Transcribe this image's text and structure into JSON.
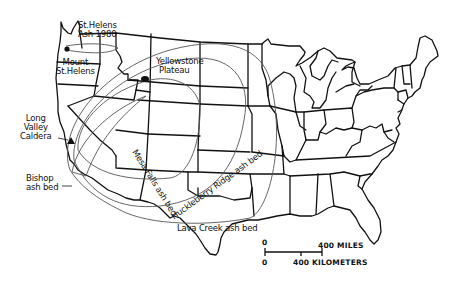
{
  "map": {
    "labels": {
      "st_helens_ash": "St Helens Ash 1980",
      "st_helens_ash_line1": "St.Helens",
      "st_helens_ash_line2": "Ash 1980",
      "mount_st_helens_line1": "Mount",
      "mount_st_helens_line2": "St.Helens",
      "yellowstone_line1": "Yellowstone",
      "yellowstone_line2": "Plateau",
      "long_valley_line1": "Long",
      "long_valley_line2": "Valley",
      "long_valley_line3": "Caldera",
      "bishop_line1": "Bishop",
      "bishop_line2": "ash bed",
      "mesa_falls": "Mesa Falls ash bed",
      "huckleberry": "Huckleberry Ridge ash bed",
      "lava_creek": "Lava Creek ash bed"
    },
    "scale": {
      "zero_top": "0",
      "zero_bottom": "0",
      "miles": "400 MILES",
      "kilometers": "400 KILOMETERS"
    },
    "colors": {
      "ink": "#111111",
      "ash_outline": "#555555",
      "background": "#ffffff"
    }
  }
}
